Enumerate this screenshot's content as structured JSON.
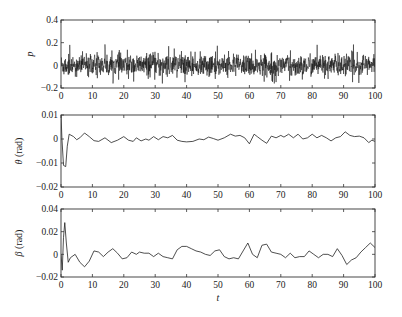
{
  "chart_data": [
    {
      "type": "line",
      "title": "",
      "xlabel": "",
      "ylabel": "p",
      "xlim": [
        0,
        100
      ],
      "ylim": [
        -0.2,
        0.4
      ],
      "xticks": [
        0,
        10,
        20,
        30,
        40,
        50,
        60,
        70,
        80,
        90,
        100
      ],
      "yticks": [
        -0.2,
        0,
        0.2,
        0.4
      ],
      "ytick_labels": [
        "−0.2",
        "0",
        "0.2",
        "0.4"
      ],
      "description": "Dense white-noise-like signal centered at 0, typical amplitude about ±0.1, occasional peaks near 0.2 and troughs near -0.15",
      "noise_amplitude": 0.09,
      "peak_max": 0.2,
      "peak_min": -0.16,
      "grid": false
    },
    {
      "type": "line",
      "title": "",
      "xlabel": "",
      "ylabel": "θ (rad)",
      "xlim": [
        0,
        100
      ],
      "ylim": [
        -0.02,
        0.01
      ],
      "xticks": [
        0,
        10,
        20,
        30,
        40,
        50,
        60,
        70,
        80,
        90,
        100
      ],
      "yticks": [
        -0.02,
        -0.01,
        0,
        0.01
      ],
      "ytick_labels": [
        "−0.02",
        "−0.01",
        "0",
        "0.01"
      ],
      "x": [
        0,
        0.3,
        0.8,
        1.5,
        2.0,
        2.6,
        4,
        5,
        6,
        7.5,
        9,
        10.5,
        12,
        14,
        16,
        18,
        20,
        21.5,
        23,
        24,
        25.5,
        27,
        28,
        29.5,
        31,
        32.5,
        34,
        35.5,
        37,
        38.5,
        40,
        42,
        44,
        45.5,
        47,
        48.5,
        50,
        52,
        54,
        55.5,
        57,
        58.5,
        60,
        61.5,
        62.5,
        64,
        65.5,
        67,
        68.5,
        70,
        71,
        72.5,
        74,
        75.5,
        77,
        78.5,
        80,
        81.5,
        83,
        84.5,
        86,
        87.5,
        89,
        90.5,
        92,
        93.5,
        95,
        96.5,
        98,
        99,
        100
      ],
      "y": [
        0.01,
        0.0,
        -0.011,
        -0.0115,
        -0.003,
        0.002,
        0.001,
        -0.0003,
        0.0005,
        0.0025,
        0.001,
        -0.0007,
        -0.001,
        0.0005,
        -0.0015,
        -0.0005,
        0.001,
        -0.0005,
        -0.001,
        0.0005,
        -0.0008,
        0.0,
        -0.0005,
        0.001,
        -0.0003,
        0.001,
        0.0005,
        0.0015,
        -0.0005,
        -0.001,
        -0.0012,
        -0.001,
        0.0,
        -0.0003,
        0.0008,
        0.0002,
        -0.0005,
        0.0005,
        0.002,
        0.0012,
        0.0015,
        0.0005,
        -0.002,
        0.002,
        0.001,
        -0.0005,
        -0.0018,
        0.0012,
        0.0005,
        0.0015,
        0.0008,
        0.002,
        0.0005,
        0.002,
        0.0,
        0.0005,
        0.002,
        0.0005,
        0.0015,
        0.0005,
        -0.0008,
        0.0005,
        0.001,
        0.003,
        0.0015,
        0.001,
        0.0012,
        0.0005,
        -0.0015,
        -0.0005,
        -0.001
      ],
      "grid": false
    },
    {
      "type": "line",
      "title": "",
      "xlabel": "t",
      "ylabel": "β (rad)",
      "xlim": [
        0,
        100
      ],
      "ylim": [
        -0.02,
        0.04
      ],
      "xticks": [
        0,
        10,
        20,
        30,
        40,
        50,
        60,
        70,
        80,
        90,
        100
      ],
      "yticks": [
        -0.02,
        0,
        0.02,
        0.04
      ],
      "ytick_labels": [
        "−0.02",
        "0",
        "0.02",
        "0.04"
      ],
      "x": [
        0,
        0.4,
        0.8,
        1.2,
        1.7,
        2.3,
        3,
        4.5,
        6,
        7.5,
        9,
        10.5,
        12,
        13.5,
        15,
        16.5,
        18,
        19.5,
        21,
        22.5,
        24,
        25,
        26.5,
        28,
        29.5,
        31,
        32.5,
        34,
        35.5,
        37,
        38.5,
        40,
        41.5,
        43,
        44.5,
        46,
        47.5,
        49,
        50.5,
        52,
        53.5,
        55,
        56.5,
        58,
        59.5,
        61,
        62.5,
        64,
        65.5,
        67,
        68.5,
        70,
        71.5,
        73,
        74.5,
        76,
        77.5,
        79,
        80.5,
        82,
        83.5,
        85,
        86.5,
        88,
        89.5,
        91,
        92.5,
        94,
        95.5,
        97,
        98.5,
        100
      ],
      "y": [
        0.0,
        -0.014,
        0.015,
        0.028,
        0.01,
        -0.007,
        -0.003,
        0.0,
        -0.007,
        -0.011,
        -0.006,
        0.003,
        0.002,
        -0.002,
        0.002,
        0.005,
        0.001,
        -0.004,
        -0.003,
        0.002,
        0.0,
        0.002,
        0.001,
        0.001,
        -0.002,
        0.001,
        -0.002,
        -0.003,
        -0.004,
        0.004,
        0.007,
        0.007,
        0.005,
        0.003,
        0.002,
        0.0,
        -0.001,
        0.003,
        0.004,
        -0.002,
        -0.004,
        -0.003,
        -0.004,
        0.003,
        0.01,
        0.0,
        -0.003,
        0.008,
        0.009,
        0.002,
        0.001,
        0.0,
        -0.003,
        0.001,
        -0.003,
        -0.002,
        -0.002,
        0.003,
        0.0,
        -0.003,
        0.0,
        0.0,
        -0.002,
        0.005,
        -0.001,
        -0.009,
        -0.005,
        -0.003,
        0.002,
        0.006,
        0.01,
        0.006
      ],
      "grid": false
    }
  ]
}
